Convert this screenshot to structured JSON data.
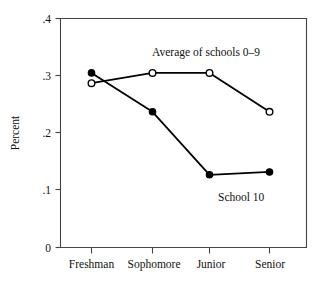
{
  "chart_data": {
    "type": "line",
    "title": "",
    "subtitle": "",
    "xlabel": "",
    "ylabel": "Percent",
    "categories": [
      "Freshman",
      "Sophomore",
      "Junior",
      "Senior"
    ],
    "ylim": [
      0,
      0.4
    ],
    "ytick_labels": [
      ".4",
      ".3",
      ".2",
      ".1",
      "0"
    ],
    "ytick_values": [
      0.4,
      0.3,
      0.2,
      0.1,
      0
    ],
    "grid": false,
    "legend_position": "inline-annotations",
    "series": [
      {
        "name": "Average of schools 0-9",
        "marker": "open-circle",
        "values": [
          0.287,
          0.305,
          0.305,
          0.237
        ]
      },
      {
        "name": "School 10",
        "marker": "filled-circle",
        "values": [
          0.305,
          0.237,
          0.127,
          0.132
        ]
      }
    ],
    "annotations": [
      {
        "text": "Average of schools 0–9",
        "x": 0.62,
        "y": 0.345
      },
      {
        "text": "School 10",
        "x": 0.72,
        "y": 0.108
      }
    ]
  },
  "axes": {
    "y_title": "Percent",
    "y_ticks": [
      {
        "label": ".4",
        "value": 0.4
      },
      {
        "label": ".3",
        "value": 0.3
      },
      {
        "label": ".2",
        "value": 0.2
      },
      {
        "label": ".1",
        "value": 0.1
      },
      {
        "label": "0",
        "value": 0
      }
    ],
    "x_ticks": [
      {
        "label": "Freshman"
      },
      {
        "label": "Sophomore"
      },
      {
        "label": "Junior"
      },
      {
        "label": "Senior"
      }
    ]
  },
  "annotations": {
    "average_label": "Average of schools –0–9",
    "average_label_text": "Average of schools 0–9",
    "school10_label": "School 10"
  },
  "colors": {
    "line": "#000000",
    "axis": "#444444",
    "background": "#ffffff",
    "marker_open_fill": "#ffffff"
  }
}
